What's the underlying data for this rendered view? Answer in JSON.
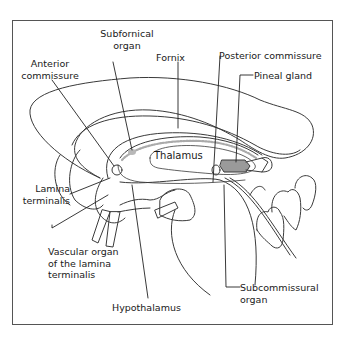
{
  "diagram": {
    "colors": {
      "line": "#3a3a3a",
      "label": "#1a1a1a",
      "pineal_fill": "#9a9a9a",
      "organ_shade": "#b8b8b8",
      "background": "#ffffff"
    },
    "labels": {
      "subfornical_organ": "Subfornical\norgan",
      "anterior_commissure": "Anterior\ncommissure",
      "fornix": "Fornix",
      "posterior_commissure": "Posterior commissure",
      "pineal_gland": "Pineal gland",
      "thalamus": "Thalamus",
      "lamina_terminalis": "Lamina\nterminalis",
      "vascular_organ": "Vascular organ\nof the lamina\nterminalis",
      "hypothalamus": "Hypothalamus",
      "subcommissural_organ": "Subcommissural\norgan"
    }
  }
}
